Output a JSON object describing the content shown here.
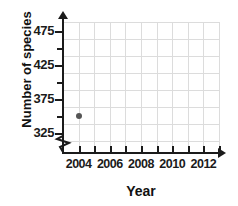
{
  "chart_data": {
    "type": "scatter",
    "title": "",
    "xlabel": "Year",
    "ylabel": "Number of species",
    "xlim": [
      2003,
      2013
    ],
    "ylim": [
      300,
      487.5
    ],
    "grid": true,
    "legend": null,
    "x_tick_labels": [
      "2004",
      "2006",
      "2008",
      "2010",
      "2012"
    ],
    "x_tick_values": [
      2004,
      2006,
      2008,
      2010,
      2012
    ],
    "x_minor_tick_values": [
      2004,
      2005,
      2006,
      2007,
      2008,
      2009,
      2010,
      2011,
      2012,
      2013
    ],
    "y_tick_labels": [
      "475",
      "425",
      "375",
      "325"
    ],
    "y_tick_values": [
      475,
      425,
      375,
      325
    ],
    "y_minor_tick_values": [
      325,
      350,
      375,
      400,
      425,
      450,
      475
    ],
    "y_axis_break": true,
    "points": [
      {
        "x": 2004,
        "y": 350
      }
    ],
    "point_color": "#555555",
    "axis_color": "#1b1b1b",
    "grid_color": "#dcdcdc"
  }
}
